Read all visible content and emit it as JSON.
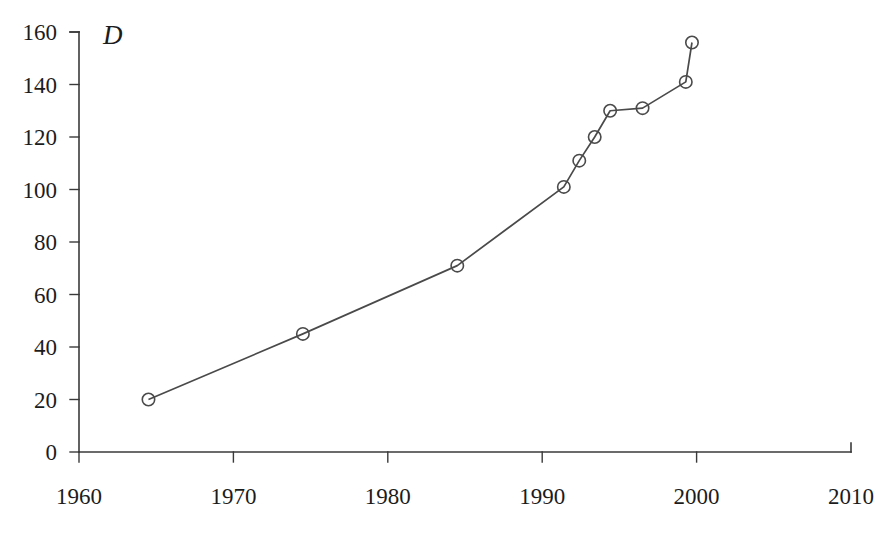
{
  "chart_data": {
    "type": "line",
    "title": "",
    "subtitle": "",
    "xlabel": "",
    "ylabel": "",
    "series_label": "D",
    "xlim": [
      1960,
      2010
    ],
    "ylim": [
      0,
      160
    ],
    "xticks": [
      1960,
      1970,
      1980,
      1990,
      2000,
      2010
    ],
    "xtick_labels": [
      "1960",
      "1970",
      "1980",
      "1990",
      "2000",
      "2010"
    ],
    "yticks": [
      0,
      20,
      40,
      60,
      80,
      100,
      120,
      140,
      160
    ],
    "ytick_labels": [
      "0",
      "20",
      "40",
      "60",
      "80",
      "100",
      "120",
      "140",
      "160"
    ],
    "grid": false,
    "legend": "none",
    "marker": "open-circle",
    "line_color": "#4a4a4a",
    "marker_color": "#4a4a4a",
    "axis_color": "#3a3a3a",
    "background_color": "#ffffff",
    "series": [
      {
        "name": "D",
        "x": [
          1964.5,
          1974.5,
          1984.5,
          1991.4,
          1992.4,
          1993.4,
          1994.4,
          1996.5,
          1999.3,
          1999.7
        ],
        "values": [
          20,
          45,
          71,
          101,
          111,
          120,
          130,
          131,
          141,
          156
        ]
      }
    ]
  }
}
